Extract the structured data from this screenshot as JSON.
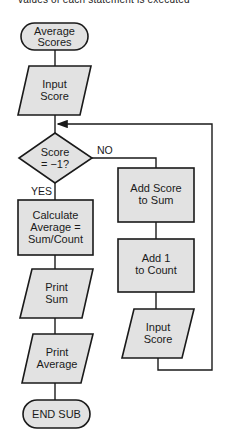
{
  "header": {
    "cut_text": "values of each statement is executed"
  },
  "flowchart": {
    "colors": {
      "fill": "#e2e2e2",
      "stroke": "#1a1a1a",
      "background": "#ffffff"
    },
    "nodes": {
      "start": {
        "type": "terminator",
        "lines": [
          "Average",
          "Scores"
        ]
      },
      "input1": {
        "type": "io",
        "lines": [
          "Input",
          "Score"
        ]
      },
      "decision": {
        "type": "decision",
        "lines": [
          "Score",
          "= −1?"
        ]
      },
      "calc": {
        "type": "process",
        "lines": [
          "Calculate",
          "Average =",
          "Sum/Count"
        ]
      },
      "print_sum": {
        "type": "io",
        "lines": [
          "Print",
          "Sum"
        ]
      },
      "print_avg": {
        "type": "io",
        "lines": [
          "Print",
          "Average"
        ]
      },
      "end": {
        "type": "terminator",
        "lines": [
          "END SUB"
        ]
      },
      "add_sum": {
        "type": "process",
        "lines": [
          "Add Score",
          "to Sum"
        ]
      },
      "add_count": {
        "type": "process",
        "lines": [
          "Add 1",
          "to Count"
        ]
      },
      "input2": {
        "type": "io",
        "lines": [
          "Input",
          "Score"
        ]
      }
    },
    "edge_labels": {
      "no": "NO",
      "yes": "YES"
    }
  }
}
